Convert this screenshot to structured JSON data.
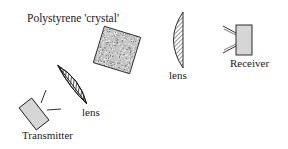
{
  "diagram": {
    "title": "Polystyrene 'crystal'",
    "components": [
      {
        "id": "transmitter",
        "label": "Transmitter",
        "shape": "rotated-box-with-horn"
      },
      {
        "id": "lens1",
        "label": "lens",
        "shape": "hatched-plano-convex-lens"
      },
      {
        "id": "crystal",
        "label": "Polystyrene 'crystal'",
        "shape": "rotated-speckled-square"
      },
      {
        "id": "lens2",
        "label": "lens",
        "shape": "hatched-plano-convex-lens"
      },
      {
        "id": "receiver",
        "label": "Receiver",
        "shape": "box-with-horn"
      }
    ],
    "labels": {
      "crystal": "Polystyrene 'crystal'",
      "lens1": "lens",
      "lens2": "lens",
      "receiver": "Receiver",
      "transmitter": "Transmitter"
    },
    "colors": {
      "box_fill": "#d6d6d6",
      "outline": "#1a1a1a",
      "crystal_dark": "#222222",
      "crystal_light": "#e8e8e8",
      "background": "#ffffff"
    }
  }
}
